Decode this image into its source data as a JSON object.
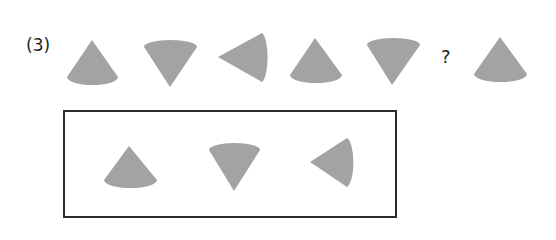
{
  "problem": {
    "number_label": "(3)",
    "missing_marker": "?",
    "fill_color": "#A3A3A3",
    "border_color": "#2A2A2A",
    "sequence": [
      {
        "shape": "cone",
        "orientation": "apex-up"
      },
      {
        "shape": "cone",
        "orientation": "apex-down"
      },
      {
        "shape": "cone",
        "orientation": "apex-left"
      },
      {
        "shape": "cone",
        "orientation": "apex-up"
      },
      {
        "shape": "cone",
        "orientation": "apex-down"
      },
      {
        "shape": "missing",
        "orientation": "?"
      },
      {
        "shape": "cone",
        "orientation": "apex-up"
      }
    ],
    "options": [
      {
        "shape": "cone",
        "orientation": "apex-up"
      },
      {
        "shape": "cone",
        "orientation": "apex-down"
      },
      {
        "shape": "cone",
        "orientation": "apex-left"
      }
    ]
  }
}
